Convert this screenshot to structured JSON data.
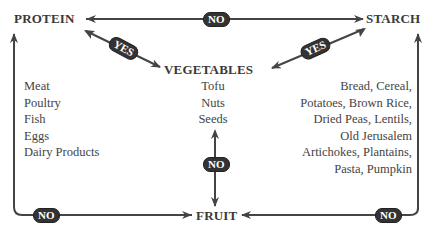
{
  "nodes": {
    "protein": "PROTEIN",
    "starch": "STARCH",
    "vegetables": "VEGETABLES",
    "fruit": "FRUIT"
  },
  "lists": {
    "protein": [
      "Meat",
      "Poultry",
      "Fish",
      "Eggs",
      "Dairy Products"
    ],
    "vegetables": [
      "Tofu",
      "Nuts",
      "Seeds"
    ],
    "starch": [
      "Bread, Cereal,",
      "Potatoes, Brown Rice,",
      "Dried Peas, Lentils,",
      "Old Jerusalem",
      "Artichokes, Plantains,",
      "Pasta, Pumpkin"
    ]
  },
  "edges": {
    "protein_starch": "NO",
    "protein_vegetables": "YES",
    "starch_vegetables": "YES",
    "vegetables_fruit": "NO",
    "protein_fruit": "NO",
    "starch_fruit": "NO"
  },
  "colors": {
    "line": "#444444",
    "badge_bg": "#333333",
    "badge_text": "#ffffff"
  }
}
